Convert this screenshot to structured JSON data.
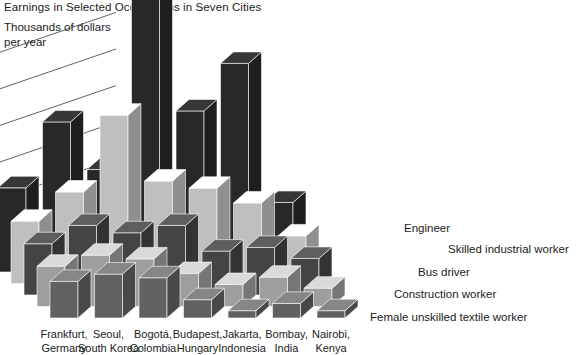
{
  "title": "Earnings in Selected Occupations in Seven Cities",
  "axis_label_line1": "Thousands of dollars",
  "axis_label_line2": "per year",
  "chart_data": {
    "type": "bar",
    "title": "Earnings in Selected Occupations in Seven Cities",
    "subtitle": "",
    "xlabel": "",
    "ylabel": "Thousands of dollars per year",
    "ylim": [
      0,
      80
    ],
    "yticks": [
      0,
      10,
      20,
      30,
      40,
      50,
      60
    ],
    "ytick_labels": [
      "0",
      "10",
      "20",
      "30",
      "40",
      "50",
      "60"
    ],
    "grid": true,
    "legend_position": "right",
    "projection": "3d-isometric",
    "categories": [
      "Frankfurt, Germany",
      "Seoul, South Korea",
      "Bogotá, Colombia",
      "Budapest, Hungary",
      "Jakarta, Indonesia",
      "Bombay, India",
      "Nairobi, Kenya"
    ],
    "category_lines": [
      [
        "Frankfurt,",
        "Germany"
      ],
      [
        "Seoul,",
        "South Korea"
      ],
      [
        "Bogotá,",
        "Colombia"
      ],
      [
        "Budapest,",
        "Hungary"
      ],
      [
        "Jakarta,",
        "Indonesia"
      ],
      [
        "Bombay,",
        "India"
      ],
      [
        "Nairobi,",
        "Kenya"
      ]
    ],
    "series": [
      {
        "name": "Engineer",
        "color": "#2d2d2d",
        "values": [
          23,
          41,
          28,
          75,
          44,
          57,
          19
        ]
      },
      {
        "name": "Skilled industrial worker",
        "color": "#d9d9d9",
        "values": [
          17,
          25,
          46,
          28,
          26,
          22,
          13
        ]
      },
      {
        "name": "Bus driver",
        "color": "#4d4d4d",
        "values": [
          14,
          19,
          17,
          19,
          12,
          13,
          10
        ]
      },
      {
        "name": "Construction worker",
        "color": "#b3b3b3",
        "values": [
          11,
          14,
          13,
          9,
          6,
          8,
          5
        ]
      },
      {
        "name": "Female unskilled textile worker",
        "color": "#6e6e6e",
        "values": [
          10,
          12,
          11,
          5,
          2,
          4,
          2
        ]
      }
    ]
  },
  "legend": {
    "items": [
      "Engineer",
      "Skilled industrial worker",
      "Bus driver",
      "Construction worker",
      "Female unskilled textile worker"
    ]
  }
}
